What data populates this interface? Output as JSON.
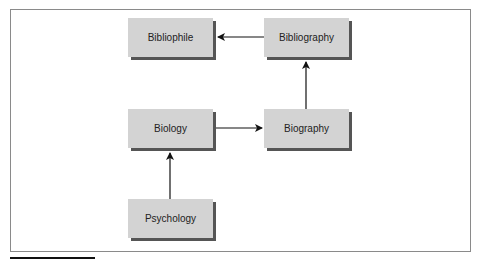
{
  "diagram": {
    "nodes": [
      {
        "id": "bibliophile",
        "label": "Bibliophile"
      },
      {
        "id": "bibliography",
        "label": "Bibliography"
      },
      {
        "id": "biology",
        "label": "Biology"
      },
      {
        "id": "biography",
        "label": "Biography"
      },
      {
        "id": "psychology",
        "label": "Psychology"
      }
    ],
    "edges": [
      {
        "from": "bibliography",
        "to": "bibliophile"
      },
      {
        "from": "biography",
        "to": "bibliography"
      },
      {
        "from": "biology",
        "to": "biography"
      },
      {
        "from": "psychology",
        "to": "biology"
      }
    ],
    "colors": {
      "node_fill": "#d3d3d3",
      "node_shadow": "#555555",
      "edge": "#111111",
      "frame": "#8a8a8a"
    }
  }
}
